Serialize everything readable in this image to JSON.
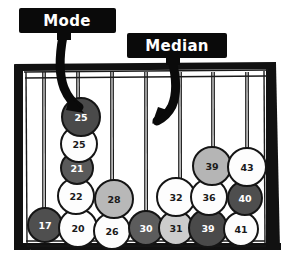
{
  "figure": {
    "frame_color": "#111111",
    "background_color": "#ffffff"
  },
  "callouts": [
    {
      "name": "mode",
      "label": "Mode",
      "box": {
        "x": 19,
        "y": 8,
        "w": 97,
        "h": 25
      },
      "text_x": 67,
      "text_y": 21,
      "tail": {
        "x": 57,
        "y": 33,
        "w": 14,
        "h": 7
      },
      "arrow_points_to": {
        "x": 79,
        "y": 110
      }
    },
    {
      "name": "median",
      "label": "Median",
      "box": {
        "x": 127,
        "y": 33,
        "w": 100,
        "h": 25
      },
      "text_x": 177,
      "text_y": 46,
      "tail": {
        "x": 166,
        "y": 58,
        "w": 14,
        "h": 7
      },
      "arrow_points_to": {
        "x": 157,
        "y": 122
      }
    }
  ],
  "strings": [
    {
      "x": 44,
      "top": 72,
      "bottom": 222
    },
    {
      "x": 78,
      "top": 72,
      "bottom": 118
    },
    {
      "x": 112,
      "top": 72,
      "bottom": 192
    },
    {
      "x": 146,
      "top": 72,
      "bottom": 222
    },
    {
      "x": 180,
      "top": 72,
      "bottom": 222
    },
    {
      "x": 213,
      "top": 72,
      "bottom": 190
    },
    {
      "x": 247,
      "top": 72,
      "bottom": 162
    }
  ],
  "chart_data": {
    "type": "dotplot",
    "xlabel": "",
    "ylabel": "",
    "grid": false,
    "legend": "none",
    "shade_legend": {
      "dark": "#4a4a4a",
      "mid_gray": "#a9a9a9",
      "light_gray": "#cfcfcf",
      "white": "#fdfdfd"
    },
    "annotations": [
      {
        "label": "Mode",
        "value": 25,
        "note": "stack of repeated value 25"
      },
      {
        "label": "Median",
        "value": 30,
        "note": "middle of ordered data"
      }
    ],
    "columns": [
      {
        "x": 44,
        "values": [
          17
        ]
      },
      {
        "x": 78,
        "values": [
          20,
          22,
          21,
          25,
          25
        ]
      },
      {
        "x": 112,
        "values": [
          26,
          28
        ]
      },
      {
        "x": 146,
        "values": [
          30
        ]
      },
      {
        "x": 180,
        "values": [
          31,
          32
        ]
      },
      {
        "x": 213,
        "values": [
          39,
          36,
          39
        ]
      },
      {
        "x": 247,
        "values": [
          41,
          40,
          43
        ]
      }
    ],
    "values_sorted": [
      17,
      20,
      21,
      22,
      25,
      25,
      26,
      28,
      30,
      31,
      32,
      36,
      38,
      39,
      40,
      41,
      43
    ],
    "balls": [
      {
        "id": "b17",
        "value": 17,
        "cx": 45,
        "cy": 225,
        "r": 17,
        "shade": "dark",
        "fill": "#4f4f4f",
        "text_class": "on-dark"
      },
      {
        "id": "b20",
        "value": 20,
        "cx": 78,
        "cy": 228,
        "r": 19,
        "shade": "white",
        "fill": "#fdfdfd",
        "text_class": "on-light"
      },
      {
        "id": "b22",
        "value": 22,
        "cx": 76,
        "cy": 196,
        "r": 18,
        "shade": "white",
        "fill": "#fdfdfd",
        "text_class": "on-light"
      },
      {
        "id": "b21",
        "value": 21,
        "cx": 77,
        "cy": 168,
        "r": 16,
        "shade": "dark",
        "fill": "#5a5a5a",
        "text_class": "on-dark"
      },
      {
        "id": "b25b",
        "value": 25,
        "cx": 79,
        "cy": 144,
        "r": 18,
        "shade": "white",
        "fill": "#fdfdfd",
        "text_class": "on-light"
      },
      {
        "id": "b25a",
        "value": 25,
        "cx": 81,
        "cy": 117,
        "r": 19,
        "shade": "dark",
        "fill": "#4a4a4a",
        "text_class": "on-dark"
      },
      {
        "id": "b26",
        "value": 26,
        "cx": 112,
        "cy": 231,
        "r": 18,
        "shade": "white",
        "fill": "#fdfdfd",
        "text_class": "on-light"
      },
      {
        "id": "b28",
        "value": 28,
        "cx": 114,
        "cy": 199,
        "r": 19,
        "shade": "mid_gray",
        "fill": "#b8b8b8",
        "text_class": "on-light"
      },
      {
        "id": "b30",
        "value": 30,
        "cx": 146,
        "cy": 228,
        "r": 17,
        "shade": "dark",
        "fill": "#5c5c5c",
        "text_class": "on-dark"
      },
      {
        "id": "b31",
        "value": 31,
        "cx": 176,
        "cy": 228,
        "r": 17,
        "shade": "light_gray",
        "fill": "#cccccc",
        "text_class": "on-light"
      },
      {
        "id": "b32",
        "value": 32,
        "cx": 176,
        "cy": 197,
        "r": 19,
        "shade": "white",
        "fill": "#fdfdfd",
        "text_class": "on-light"
      },
      {
        "id": "b39a",
        "value": 39,
        "cx": 208,
        "cy": 228,
        "r": 19,
        "shade": "dark",
        "fill": "#4a4a4a",
        "text_class": "on-dark"
      },
      {
        "id": "b36",
        "value": 36,
        "cx": 209,
        "cy": 197,
        "r": 18,
        "shade": "white",
        "fill": "#fdfdfd",
        "text_class": "on-light"
      },
      {
        "id": "b39b",
        "value": 39,
        "cx": 212,
        "cy": 166,
        "r": 19,
        "shade": "mid_gray",
        "fill": "#b5b5b5",
        "text_class": "on-light"
      },
      {
        "id": "b41",
        "value": 41,
        "cx": 241,
        "cy": 229,
        "r": 17,
        "shade": "white",
        "fill": "#fdfdfd",
        "text_class": "on-light"
      },
      {
        "id": "b40",
        "value": 40,
        "cx": 245,
        "cy": 198,
        "r": 17,
        "shade": "dark",
        "fill": "#4e4e4e",
        "text_class": "on-dark"
      },
      {
        "id": "b43",
        "value": 43,
        "cx": 247,
        "cy": 167,
        "r": 19,
        "shade": "white",
        "fill": "#fdfdfd",
        "text_class": "on-light"
      }
    ]
  }
}
